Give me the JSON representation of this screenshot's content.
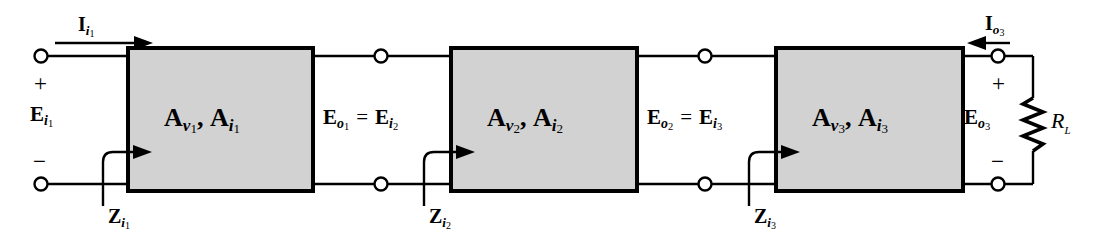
{
  "figure": {
    "type": "cascaded-amplifier-block-diagram",
    "background_color": "#ffffff",
    "line_color": "#000000",
    "block_fill_color": "#d2d2d2",
    "block_stroke_color": "#000000"
  },
  "input_port": {
    "current_label": "I",
    "current_sub": "i",
    "current_subsub": "1",
    "voltage_label": "E",
    "voltage_sub": "i",
    "voltage_subsub": "1",
    "plus_sign": "+",
    "minus_sign": "−"
  },
  "blocks": [
    {
      "id": "stage-1",
      "gain_v": "A",
      "gain_v_sub": "v",
      "gain_v_subsub": "1",
      "gain_i": "A",
      "gain_i_sub": "i",
      "gain_i_subsub": "1",
      "separator": ",",
      "impedance_label": "Z",
      "impedance_sub": "i",
      "impedance_subsub": "1"
    },
    {
      "id": "stage-2",
      "gain_v": "A",
      "gain_v_sub": "v",
      "gain_v_subsub": "2",
      "gain_i": "A",
      "gain_i_sub": "i",
      "gain_i_subsub": "2",
      "separator": ",",
      "impedance_label": "Z",
      "impedance_sub": "i",
      "impedance_subsub": "2"
    },
    {
      "id": "stage-3",
      "gain_v": "A",
      "gain_v_sub": "v",
      "gain_v_subsub": "3",
      "gain_i": "A",
      "gain_i_sub": "i",
      "gain_i_subsub": "3",
      "separator": ",",
      "impedance_label": "Z",
      "impedance_sub": "i",
      "impedance_subsub": "3"
    }
  ],
  "interstage_1": {
    "out_label": "E",
    "out_sub": "o",
    "out_subsub": "1",
    "equals": "=",
    "in_label": "E",
    "in_sub": "i",
    "in_subsub": "2"
  },
  "interstage_2": {
    "out_label": "E",
    "out_sub": "o",
    "out_subsub": "2",
    "equals": "=",
    "in_label": "E",
    "in_sub": "i",
    "in_subsub": "3"
  },
  "output_port": {
    "current_label": "I",
    "current_sub": "o",
    "current_subsub": "3",
    "voltage_label": "E",
    "voltage_sub": "o",
    "voltage_subsub": "3",
    "plus_sign": "+",
    "minus_sign": "−",
    "load_label": "R",
    "load_sub": "L"
  }
}
